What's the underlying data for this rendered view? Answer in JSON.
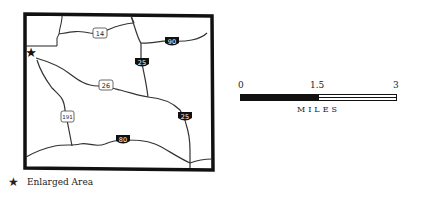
{
  "map": {
    "region": "Wyoming state outline",
    "routes": [
      {
        "id": "14",
        "type": "us-highway"
      },
      {
        "id": "90",
        "type": "interstate"
      },
      {
        "id": "25",
        "type": "interstate"
      },
      {
        "id": "26",
        "type": "us-highway"
      },
      {
        "id": "25",
        "type": "interstate"
      },
      {
        "id": "191",
        "type": "us-highway"
      },
      {
        "id": "80",
        "type": "interstate"
      }
    ],
    "marker": {
      "symbol": "★",
      "meaning": "Enlarged Area"
    }
  },
  "scale": {
    "ticks": [
      "0",
      "1.5",
      "3"
    ],
    "units": "MILES"
  },
  "legend": {
    "symbol": "★",
    "label": "Enlarged Area"
  },
  "colors": {
    "ink": "#111111",
    "background": "#ffffff"
  }
}
